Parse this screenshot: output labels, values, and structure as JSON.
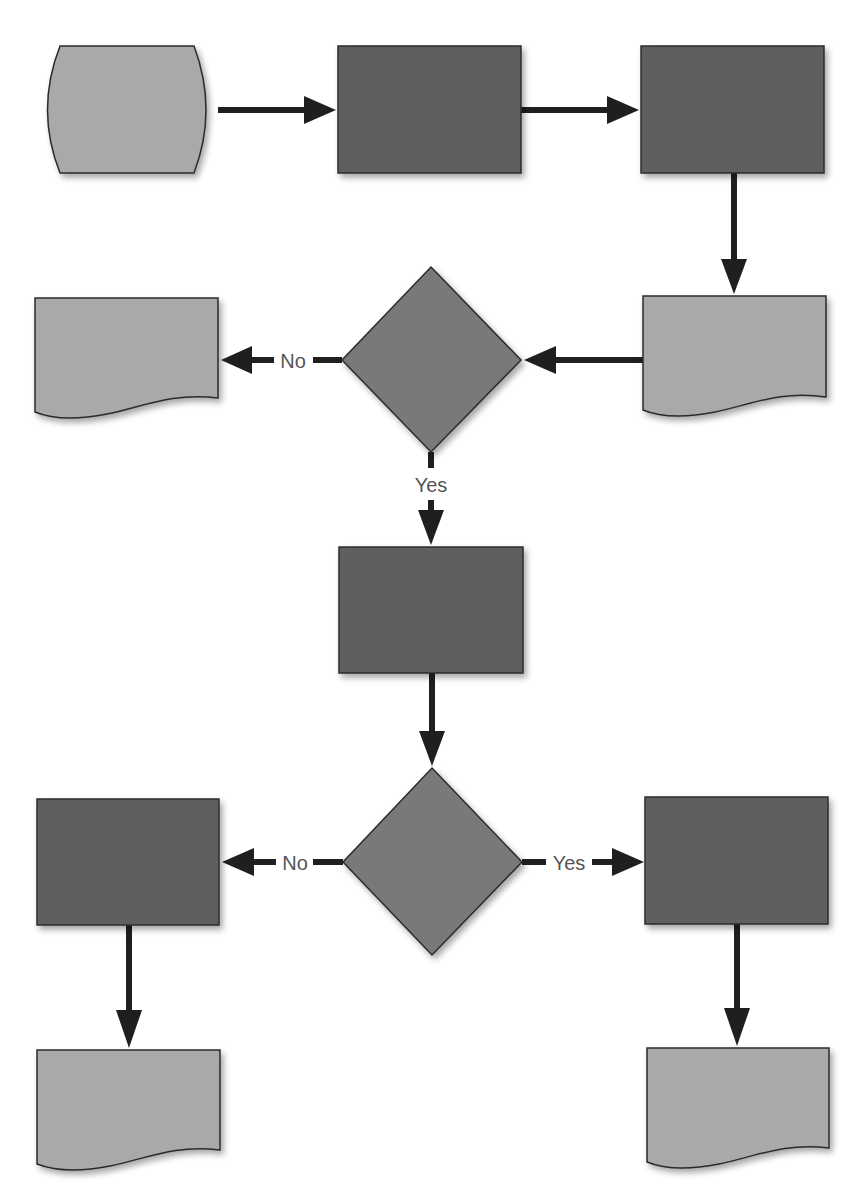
{
  "diagram": {
    "type": "flowchart",
    "colors": {
      "process": "#5f5f5f",
      "terminator": "#a9a9a9",
      "document": "#a9a9a9",
      "decision": "#797979",
      "stroke": "#2b2b2b",
      "arrow": "#1f1f1f",
      "label": "#555555",
      "background": "#ffffff"
    },
    "nodes": [
      {
        "id": "start",
        "shape": "terminator",
        "text": ""
      },
      {
        "id": "process-1",
        "shape": "process",
        "text": ""
      },
      {
        "id": "process-2",
        "shape": "process",
        "text": ""
      },
      {
        "id": "document-1",
        "shape": "document",
        "text": ""
      },
      {
        "id": "decision-1",
        "shape": "decision",
        "text": ""
      },
      {
        "id": "document-2",
        "shape": "document",
        "text": ""
      },
      {
        "id": "process-3",
        "shape": "process",
        "text": ""
      },
      {
        "id": "decision-2",
        "shape": "decision",
        "text": ""
      },
      {
        "id": "process-4",
        "shape": "process",
        "text": ""
      },
      {
        "id": "process-5",
        "shape": "process",
        "text": ""
      },
      {
        "id": "document-3",
        "shape": "document",
        "text": ""
      },
      {
        "id": "document-4",
        "shape": "document",
        "text": ""
      }
    ],
    "edges": [
      {
        "from": "start",
        "to": "process-1",
        "label": ""
      },
      {
        "from": "process-1",
        "to": "process-2",
        "label": ""
      },
      {
        "from": "process-2",
        "to": "document-1",
        "label": ""
      },
      {
        "from": "document-1",
        "to": "decision-1",
        "label": ""
      },
      {
        "from": "decision-1",
        "to": "document-2",
        "label": "No"
      },
      {
        "from": "decision-1",
        "to": "process-3",
        "label": "Yes"
      },
      {
        "from": "process-3",
        "to": "decision-2",
        "label": ""
      },
      {
        "from": "decision-2",
        "to": "process-4",
        "label": "No"
      },
      {
        "from": "decision-2",
        "to": "process-5",
        "label": "Yes"
      },
      {
        "from": "process-4",
        "to": "document-3",
        "label": ""
      },
      {
        "from": "process-5",
        "to": "document-4",
        "label": ""
      }
    ],
    "labels": {
      "decision1_no": "No",
      "decision1_yes": "Yes",
      "decision2_no": "No",
      "decision2_yes": "Yes"
    }
  }
}
